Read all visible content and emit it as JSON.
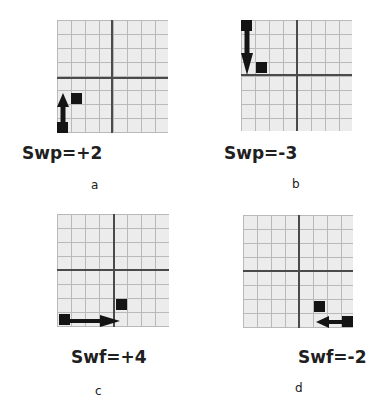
{
  "panels": [
    {
      "id": "a",
      "formula": "Swp=+2",
      "letter": "a",
      "direction": "up",
      "value": 2,
      "grid": {
        "cols": 8,
        "rows": 8
      }
    },
    {
      "id": "b",
      "formula": "Swp=-3",
      "letter": "b",
      "direction": "down",
      "value": -3,
      "grid": {
        "cols": 8,
        "rows": 8
      }
    },
    {
      "id": "c",
      "formula": "Swf=+4",
      "letter": "c",
      "direction": "right",
      "value": 4,
      "grid": {
        "cols": 8,
        "rows": 8
      }
    },
    {
      "id": "d",
      "formula": "Swf=-2",
      "letter": "d",
      "direction": "left",
      "value": -2,
      "grid": {
        "cols": 8,
        "rows": 8
      }
    }
  ],
  "colors": {
    "grid_bg": "#ececec",
    "grid_line": "#b9b9b9",
    "axis": "#4a4a4a",
    "marker": "#141414",
    "text": "#202020"
  }
}
